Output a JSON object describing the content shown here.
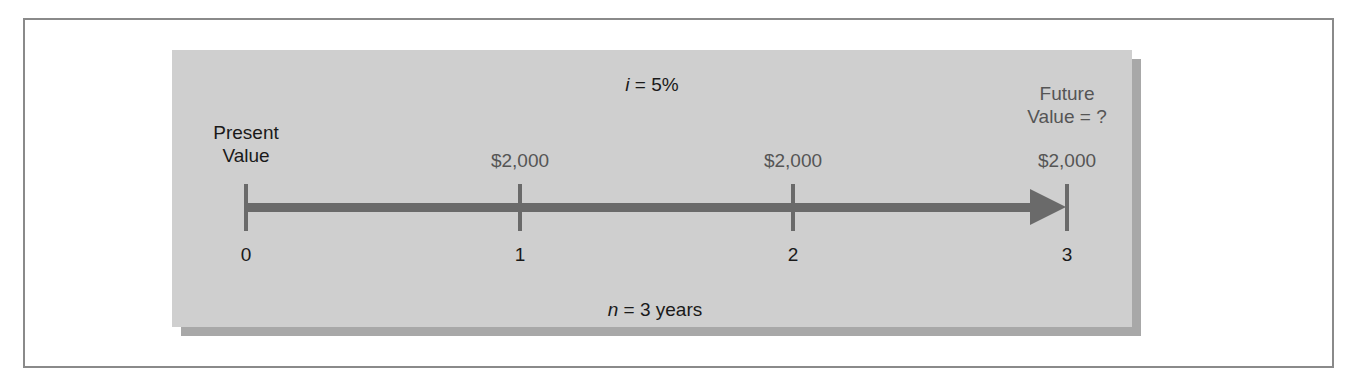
{
  "diagram": {
    "type": "timeline",
    "interest_rate": {
      "symbol": "i",
      "rest": " = 5%"
    },
    "periods": {
      "symbol": "n",
      "rest": " = 3 years"
    },
    "present_value_label": [
      "Present",
      "Value"
    ],
    "future_value_label": [
      "Future",
      "Value = ?"
    ],
    "ticks": [
      {
        "period": "0",
        "payment": ""
      },
      {
        "period": "1",
        "payment": "$2,000"
      },
      {
        "period": "2",
        "payment": "$2,000"
      },
      {
        "period": "3",
        "payment": "$2,000"
      }
    ]
  },
  "colors": {
    "panel": "#cfcfcf",
    "axis": "#6a6a6a",
    "text_dark": "#1a1a1a",
    "text_grey": "#555555"
  }
}
